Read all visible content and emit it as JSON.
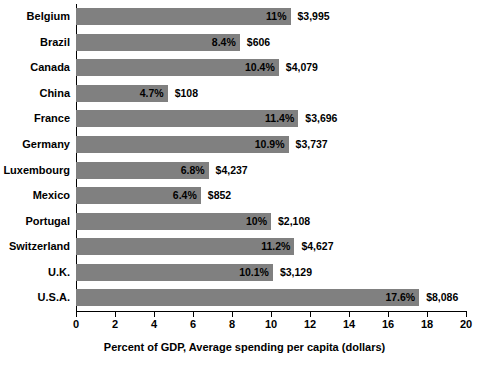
{
  "chart_data": {
    "type": "bar",
    "orientation": "horizontal",
    "title": "",
    "xlabel": "Percent of GDP, Average spending per capita (dollars)",
    "ylabel": "",
    "xlim": [
      0,
      20
    ],
    "xticks": [
      0,
      2,
      4,
      6,
      8,
      10,
      12,
      14,
      16,
      18,
      20
    ],
    "xtick_labels": [
      "0",
      "2",
      "4",
      "6",
      "8",
      "10",
      "12",
      "14",
      "16",
      "18",
      "20"
    ],
    "grid": false,
    "legend": "none",
    "bar_color": "#808080",
    "categories": [
      "Belgium",
      "Brazil",
      "Canada",
      "China",
      "France",
      "Germany",
      "Luxembourg",
      "Mexico",
      "Portugal",
      "Switzerland",
      "U.K.",
      "U.S.A."
    ],
    "values": [
      11,
      8.4,
      10.4,
      4.7,
      11.4,
      10.9,
      6.8,
      6.4,
      10,
      11.2,
      10.1,
      17.6
    ],
    "percent_labels": [
      "11%",
      "8.4%",
      "10.4%",
      "4.7%",
      "11.4%",
      "10.9%",
      "6.8%",
      "6.4%",
      "10%",
      "11.2%",
      "10.1%",
      "17.6%"
    ],
    "spending_labels": [
      "$3,995",
      "$606",
      "$4,079",
      "$108",
      "$3,696",
      "$3,737",
      "$4,237",
      "$852",
      "$2,108",
      "$4,627",
      "$3,129",
      "$8,086"
    ],
    "rows": [
      {
        "category": "Belgium",
        "percent": 11,
        "percent_label": "11%",
        "spending_label": "$3,995"
      },
      {
        "category": "Brazil",
        "percent": 8.4,
        "percent_label": "8.4%",
        "spending_label": "$606"
      },
      {
        "category": "Canada",
        "percent": 10.4,
        "percent_label": "10.4%",
        "spending_label": "$4,079"
      },
      {
        "category": "China",
        "percent": 4.7,
        "percent_label": "4.7%",
        "spending_label": "$108"
      },
      {
        "category": "France",
        "percent": 11.4,
        "percent_label": "11.4%",
        "spending_label": "$3,696"
      },
      {
        "category": "Germany",
        "percent": 10.9,
        "percent_label": "10.9%",
        "spending_label": "$3,737"
      },
      {
        "category": "Luxembourg",
        "percent": 6.8,
        "percent_label": "6.8%",
        "spending_label": "$4,237"
      },
      {
        "category": "Mexico",
        "percent": 6.4,
        "percent_label": "6.4%",
        "spending_label": "$852"
      },
      {
        "category": "Portugal",
        "percent": 10,
        "percent_label": "10%",
        "spending_label": "$2,108"
      },
      {
        "category": "Switzerland",
        "percent": 11.2,
        "percent_label": "11.2%",
        "spending_label": "$4,627"
      },
      {
        "category": "U.K.",
        "percent": 10.1,
        "percent_label": "10.1%",
        "spending_label": "$3,129"
      },
      {
        "category": "U.S.A.",
        "percent": 17.6,
        "percent_label": "17.6%",
        "spending_label": "$8,086"
      }
    ]
  }
}
